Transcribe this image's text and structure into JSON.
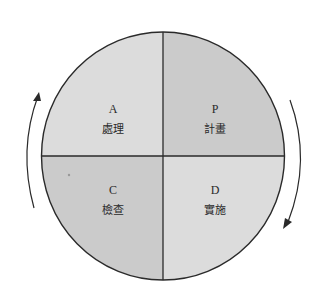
{
  "diagram": {
    "type": "PDCA cycle",
    "colors": {
      "background": "#ffffff",
      "outline": "#2a2a2a",
      "light_fill": "#dcdcdc",
      "dark_fill": "#cbcbcb",
      "arrow": "#2a2a2a"
    },
    "quadrants": [
      {
        "position": "top-left",
        "letter": "A",
        "label": "處理",
        "fill": "#dcdcdc"
      },
      {
        "position": "top-right",
        "letter": "P",
        "label": "計畫",
        "fill": "#cbcbcb"
      },
      {
        "position": "bottom-left",
        "letter": "C",
        "label": "檢查",
        "fill": "#cbcbcb"
      },
      {
        "position": "bottom-right",
        "letter": "D",
        "label": "實施",
        "fill": "#dcdcdc"
      }
    ],
    "arrows": [
      {
        "side": "left",
        "direction": "up"
      },
      {
        "side": "right",
        "direction": "down"
      }
    ]
  }
}
